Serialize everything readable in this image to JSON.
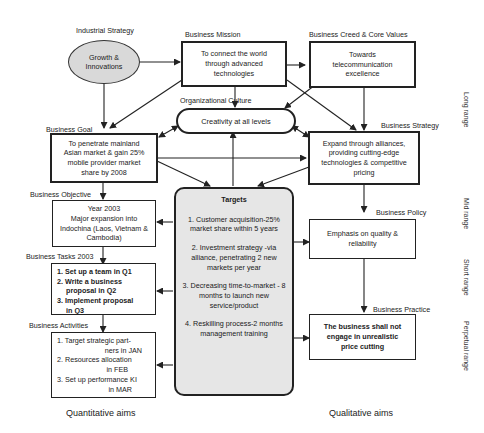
{
  "diagram": {
    "nodes": {
      "industrial_strategy": {
        "heading": "Industrial Strategy",
        "text": "Growth & Innovations"
      },
      "business_mission": {
        "heading": "Business Mission",
        "text": "To connect the world through advanced technologies"
      },
      "business_creed": {
        "heading": "Business Creed & Core Values",
        "text": "Towards telecommunication excellence"
      },
      "organizational_culture": {
        "heading": "Organizational Culture",
        "text": "Creativity at all levels"
      },
      "business_goal": {
        "heading": "Business Goal",
        "text": "To penetrate mainland Asian market & gain 25% mobile provider market share by 2008"
      },
      "business_strategy": {
        "heading": "Business Strategy",
        "text": "Expand through alliances, providing cutting-edge technologies & competitive pricing"
      },
      "business_objective": {
        "heading": "Business Objective",
        "lines": [
          "Year 2003",
          "Major expansion into",
          "Indochina (Laos, Vietnam &",
          "Cambodia)"
        ]
      },
      "business_tasks": {
        "heading": "Business Tasks 2003",
        "items": [
          "1. Set up a team in Q1",
          "2. Write a business",
          "proposal in Q2",
          "3. Implement proposal",
          "in Q3"
        ]
      },
      "business_activities": {
        "heading": "Business Activities",
        "items": [
          "1. Target strategic part-",
          "ners in JAN",
          "2. Resources allocation",
          "in FEB",
          "3. Set up performance KI",
          "in MAR"
        ]
      },
      "targets": {
        "heading": "Targets",
        "items": [
          "1. Customer acquisition-25% market share within 5 years",
          "2. Investment strategy -via alliance, penetrating 2 new markets per year",
          "3. Decreasing time-to-market - 8 months to launch new service/product",
          "4. Reskilling process-2 months management training"
        ]
      },
      "business_policy": {
        "heading": "Business Policy",
        "text": "Emphasis on quality & reliability"
      },
      "business_practice": {
        "heading": "Business Practice",
        "text": "The business shall not engage in unrealistic price cutting"
      }
    },
    "range_labels": [
      "Long range",
      "Mid range",
      "Short range",
      "Perpetual range"
    ],
    "footer": {
      "left": "Quantitative aims",
      "right": "Qualitative aims"
    },
    "colors": {
      "line": "#222222",
      "ellipse_fill": "#d9d9d9",
      "targets_fill": "#e6e6e6",
      "background": "#ffffff"
    }
  }
}
